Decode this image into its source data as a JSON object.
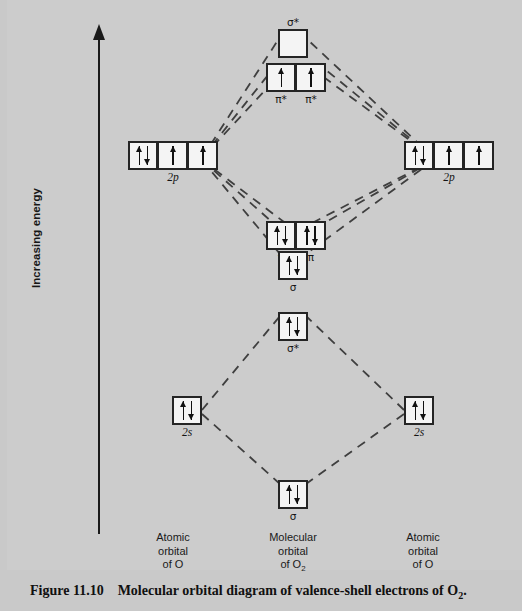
{
  "figure": {
    "number": "Figure 11.10",
    "caption_text": "Molecular orbital diagram of valence-shell electrons of O",
    "caption_subscript": "2",
    "caption_end": "."
  },
  "axis": {
    "label": "Increasing energy",
    "direction": "up-arrow-icon"
  },
  "columns": [
    {
      "name": "left-atomic",
      "line1": "Atomic",
      "line2": "orbital",
      "line3": "of O"
    },
    {
      "name": "molecular",
      "line1": "Molecular",
      "line2": "orbital",
      "line3": "of O",
      "subscript": "2"
    },
    {
      "name": "right-atomic",
      "line1": "Atomic",
      "line2": "orbital",
      "line3": "of O"
    }
  ],
  "orbitals": {
    "sigma_star_2p": {
      "label": "σ*",
      "boxes": [
        {
          "electrons": []
        }
      ]
    },
    "pi_star_2p": {
      "sublabels": [
        "π*",
        "π*"
      ],
      "boxes": [
        {
          "electrons": [
            "up"
          ]
        },
        {
          "electrons": [
            "up"
          ]
        }
      ]
    },
    "left_2p": {
      "label": "2p",
      "boxes": [
        {
          "electrons": [
            "up",
            "down"
          ]
        },
        {
          "electrons": [
            "up"
          ]
        },
        {
          "electrons": [
            "up"
          ]
        }
      ]
    },
    "right_2p": {
      "label": "2p",
      "boxes": [
        {
          "electrons": [
            "up",
            "down"
          ]
        },
        {
          "electrons": [
            "up"
          ]
        },
        {
          "electrons": [
            "up"
          ]
        }
      ]
    },
    "pi_2p": {
      "sublabels": [
        "π",
        "π"
      ],
      "boxes": [
        {
          "electrons": [
            "up",
            "down"
          ]
        },
        {
          "electrons": [
            "up",
            "down"
          ]
        }
      ]
    },
    "sigma_2p": {
      "label": "σ",
      "boxes": [
        {
          "electrons": [
            "up",
            "down"
          ]
        }
      ]
    },
    "sigma_star_2s": {
      "label": "σ*",
      "boxes": [
        {
          "electrons": [
            "up",
            "down"
          ]
        }
      ]
    },
    "left_2s": {
      "label": "2s",
      "boxes": [
        {
          "electrons": [
            "up",
            "down"
          ]
        }
      ]
    },
    "right_2s": {
      "label": "2s",
      "boxes": [
        {
          "electrons": [
            "up",
            "down"
          ]
        }
      ]
    },
    "sigma_2s": {
      "label": "σ",
      "boxes": [
        {
          "electrons": [
            "up",
            "down"
          ]
        }
      ]
    }
  },
  "colors": {
    "background": "#c9c9c9",
    "panel": "#cccccc",
    "box_fill": "#f4f4f4",
    "box_border": "#242424",
    "line": "#3a3a3a",
    "text": "#141414"
  },
  "connector_style": "dashed"
}
